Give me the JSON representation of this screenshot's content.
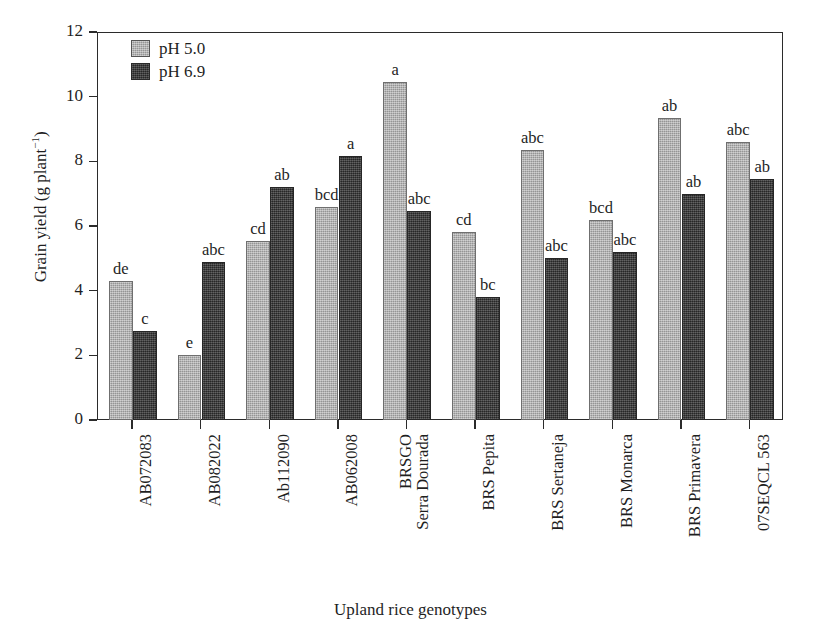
{
  "chart_data": {
    "type": "bar",
    "title": "",
    "xlabel": "Upland rice genotypes",
    "ylabel": "Grain yield (g plant-1)",
    "ylabel_base": "Grain yield (g plant",
    "ylabel_sup": "−1",
    "ylabel_close": ")",
    "ylim": [
      0,
      12
    ],
    "yticks": [
      0,
      2,
      4,
      6,
      8,
      10,
      12
    ],
    "ytick_labels": [
      "0",
      "2",
      "4",
      "6",
      "8",
      "10",
      "12"
    ],
    "grid": false,
    "legend_position": "top-left inside",
    "categories": [
      "AB072083",
      "AB082022",
      "Ab112090",
      "AB062008",
      "BRSGO Serra Dourada",
      "BRS Pepita",
      "BRS Sertaneja",
      "BRS Monarca",
      "BRS Primavera",
      "07SEQCL 563"
    ],
    "category_lines": [
      [
        "AB072083"
      ],
      [
        "AB082022"
      ],
      [
        "Ab112090"
      ],
      [
        "AB062008"
      ],
      [
        "BRSGO",
        "Serra Dourada"
      ],
      [
        "BRS Pepita"
      ],
      [
        "BRS Sertaneja"
      ],
      [
        "BRS Monarca"
      ],
      [
        "BRS Primavera"
      ],
      [
        "07SEQCL 563"
      ]
    ],
    "series": [
      {
        "name": "pH 5.0",
        "color": "#a9a9a9",
        "values": [
          4.3,
          2.0,
          5.55,
          6.6,
          10.45,
          5.8,
          8.35,
          6.2,
          9.35,
          8.6
        ],
        "annotations": [
          "de",
          "e",
          "cd",
          "bcd",
          "a",
          "cd",
          "abc",
          "bcd",
          "ab",
          "abc"
        ]
      },
      {
        "name": "pH 6.9",
        "color": "#3b3b3b",
        "values": [
          2.75,
          4.9,
          7.2,
          8.15,
          6.45,
          3.8,
          5.0,
          5.2,
          7.0,
          7.45
        ],
        "annotations": [
          "c",
          "abc",
          "ab",
          "a",
          "abc",
          "bc",
          "abc",
          "abc",
          "ab",
          "ab"
        ]
      }
    ]
  },
  "legend": {
    "items": [
      {
        "label": "pH 5.0",
        "swatch": "light"
      },
      {
        "label": "pH 6.9",
        "swatch": "dark"
      }
    ]
  }
}
